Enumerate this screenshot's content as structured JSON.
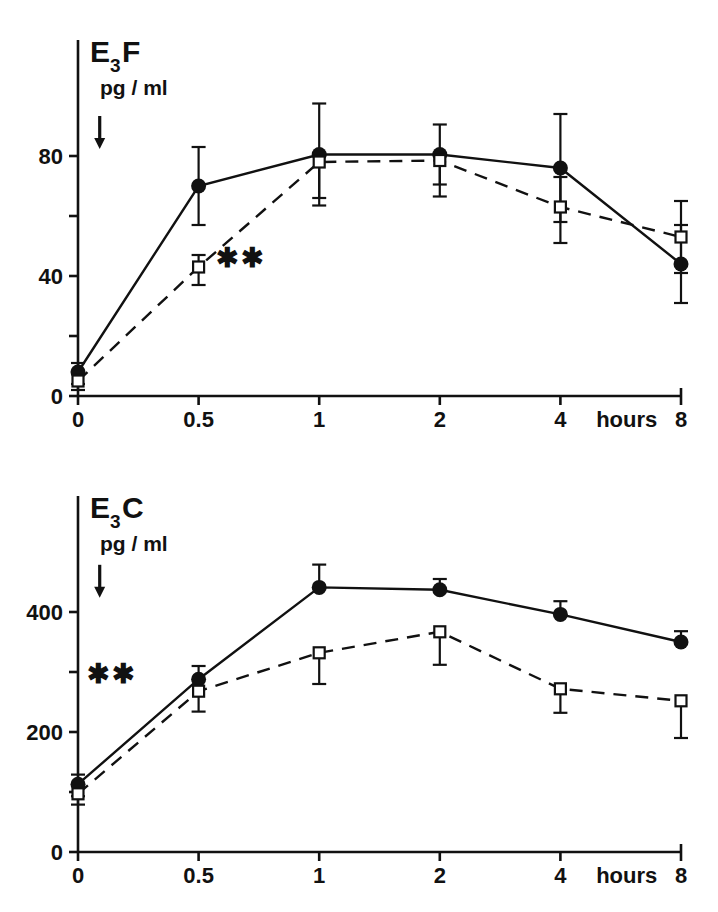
{
  "figure": {
    "background": "#ffffff",
    "ink": "#111111"
  },
  "panels": [
    {
      "id": "panel-top",
      "title_main": "E",
      "title_sub": "3",
      "title_suffix": "F",
      "units_label": "pg / ml",
      "x_axis_label": "hours",
      "x_tick_labels": [
        "0",
        "0.5",
        "1",
        "2",
        "4",
        "8"
      ],
      "y_tick_labels": [
        "0",
        "",
        "40",
        "",
        "80"
      ],
      "significance_marker": "✱✱",
      "arrow_marker": "down-arrow"
    },
    {
      "id": "panel-bottom",
      "title_main": "E",
      "title_sub": "3",
      "title_suffix": "C",
      "units_label": "pg / ml",
      "x_axis_label": "hours",
      "x_tick_labels": [
        "0",
        "0.5",
        "1",
        "2",
        "4",
        "8"
      ],
      "y_tick_labels": [
        "0",
        "",
        "200",
        "",
        "400"
      ],
      "significance_marker": "✱✱",
      "arrow_marker": "down-arrow"
    }
  ],
  "chart_data": [
    {
      "type": "line",
      "title": "E3F",
      "ylabel": "pg / ml",
      "xlabel": "hours",
      "x": [
        0,
        0.5,
        1,
        2,
        4,
        8
      ],
      "x_tick_labels": [
        "0",
        "0.5",
        "1",
        "2",
        "4",
        "8"
      ],
      "x_tick_positions": [
        0,
        1,
        2,
        3,
        4,
        5
      ],
      "xlim": [
        0,
        5
      ],
      "ylim": [
        0,
        100
      ],
      "y_ticks": [
        0,
        20,
        40,
        60,
        80
      ],
      "y_tick_labels": [
        "0",
        "",
        "40",
        "",
        "80"
      ],
      "grid": false,
      "legend": "none",
      "annotations": [
        {
          "text": "✱✱",
          "x": 1.35,
          "y": 46
        },
        {
          "text": "down-arrow",
          "x": 0.18,
          "y": 88
        }
      ],
      "series": [
        {
          "name": "filled-circle-solid",
          "marker": "filled-circle",
          "line": "solid",
          "values": [
            8,
            70,
            80.5,
            80.5,
            76,
            44
          ],
          "err_up": [
            3,
            13,
            17,
            10,
            18,
            13
          ],
          "err_down": [
            4,
            13,
            17,
            10,
            18,
            13
          ]
        },
        {
          "name": "open-square-dashed",
          "marker": "open-square",
          "line": "dashed",
          "values": [
            5,
            43,
            78,
            78.5,
            63,
            53
          ],
          "err_up": [
            3,
            4,
            2,
            2,
            10,
            12
          ],
          "err_down": [
            3,
            6,
            12,
            12,
            12,
            12
          ]
        }
      ]
    },
    {
      "type": "line",
      "title": "E3C",
      "ylabel": "pg / ml",
      "xlabel": "hours",
      "x": [
        0,
        0.5,
        1,
        2,
        4,
        8
      ],
      "x_tick_labels": [
        "0",
        "0.5",
        "1",
        "2",
        "4",
        "8"
      ],
      "x_tick_positions": [
        0,
        1,
        2,
        3,
        4,
        5
      ],
      "xlim": [
        0,
        5
      ],
      "ylim": [
        0,
        500
      ],
      "y_ticks": [
        0,
        100,
        200,
        300,
        400
      ],
      "y_tick_labels": [
        "0",
        "",
        "200",
        "",
        "400"
      ],
      "grid": false,
      "legend": "none",
      "annotations": [
        {
          "text": "✱✱",
          "x": 0.28,
          "y": 296
        },
        {
          "text": "down-arrow",
          "x": 0.18,
          "y": 452
        }
      ],
      "series": [
        {
          "name": "filled-circle-solid",
          "marker": "filled-circle",
          "line": "solid",
          "values": [
            113,
            288,
            441,
            437,
            396,
            350
          ],
          "err_up": [
            16,
            22,
            38,
            18,
            22,
            18
          ],
          "err_down": [
            20,
            0,
            0,
            0,
            0,
            0
          ]
        },
        {
          "name": "open-square-dashed",
          "marker": "open-square",
          "line": "dashed",
          "values": [
            97,
            268,
            332,
            367,
            272,
            252
          ],
          "err_up": [
            0,
            0,
            0,
            0,
            0,
            0
          ],
          "err_down": [
            18,
            34,
            52,
            55,
            40,
            62
          ]
        }
      ]
    }
  ]
}
